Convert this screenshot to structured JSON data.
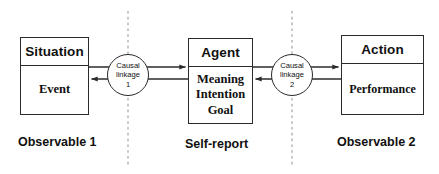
{
  "diagram": {
    "background_color": "#ffffff",
    "stroke_color": "#2b2b2b",
    "divider_color": "#8d8d8d",
    "nodes": [
      {
        "id": "situation",
        "header": "Situation",
        "body_lines": [
          "Event"
        ]
      },
      {
        "id": "agent",
        "header": "Agent",
        "body_lines": [
          "Meaning",
          "Intention",
          "Goal"
        ]
      },
      {
        "id": "action",
        "header": "Action",
        "body_lines": [
          "Performance"
        ]
      }
    ],
    "linkages": [
      {
        "id": "linkage-1",
        "label_line_1": "Causal",
        "label_line_2": "linkage",
        "label_line_3": "1"
      },
      {
        "id": "linkage-2",
        "label_line_1": "Causal",
        "label_line_2": "linkage",
        "label_line_3": "2"
      }
    ],
    "captions": {
      "observable_1": "Observable 1",
      "self_report": "Self-report",
      "observable_2": "Observable 2"
    },
    "dividers": [
      {
        "id": "divider-left",
        "x": 128
      },
      {
        "id": "divider-right",
        "x": 292
      }
    ]
  }
}
